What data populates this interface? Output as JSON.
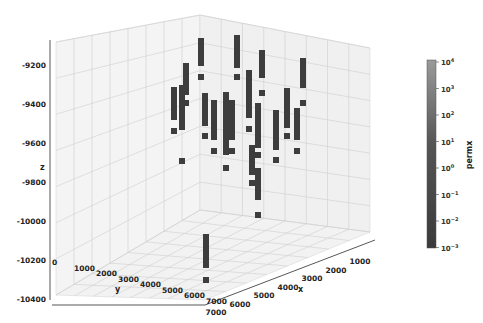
{
  "chart_data": {
    "type": "scatter3d",
    "title": "",
    "xlabel": "x",
    "ylabel": "y",
    "zlabel": "z",
    "x_ticks": [
      "1000",
      "2000",
      "3000",
      "4000",
      "5000",
      "6000",
      "7000"
    ],
    "y_ticks": [
      "0",
      "1000",
      "2000",
      "3000",
      "4000",
      "5000",
      "6000",
      "7000"
    ],
    "z_ticks": [
      "-9200",
      "-9400",
      "-9600",
      "-9800",
      "-10000",
      "-10200",
      "-10400"
    ],
    "xlim": [
      500,
      7500
    ],
    "ylim": [
      0,
      7500
    ],
    "zlim": [
      -10600,
      -9050
    ],
    "colorbar": {
      "label": "permx",
      "scale": "log",
      "ticks": [
        "10^4",
        "10^3",
        "10^2",
        "10^1",
        "10^0",
        "10^-1",
        "10^-2",
        "10^-3"
      ],
      "range": [
        0.001,
        10000
      ]
    },
    "marker": "square",
    "marker_color": "#3d3d3d",
    "grid": true,
    "wells_screen_columns": [
      {
        "sx": 201,
        "top": 38,
        "bottom": 66,
        "extra": 74
      },
      {
        "sx": 237,
        "top": 35,
        "bottom": 68,
        "extra": 74
      },
      {
        "sx": 262,
        "top": 50,
        "bottom": 78,
        "extra": 90
      },
      {
        "sx": 303,
        "top": 58,
        "bottom": 88,
        "extra": 100
      },
      {
        "sx": 186,
        "top": 63,
        "bottom": 95,
        "extra": 100
      },
      {
        "sx": 174,
        "top": 87,
        "bottom": 120,
        "extra": 128
      },
      {
        "sx": 182,
        "top": 85,
        "bottom": 130,
        "extra": 158
      },
      {
        "sx": 205,
        "top": 93,
        "bottom": 126,
        "extra": 133
      },
      {
        "sx": 214,
        "top": 100,
        "bottom": 140,
        "extra": 148
      },
      {
        "sx": 226,
        "top": 92,
        "bottom": 155,
        "extra": 165
      },
      {
        "sx": 232,
        "top": 100,
        "bottom": 140,
        "extra": 148
      },
      {
        "sx": 249,
        "top": 70,
        "bottom": 118,
        "extra": 126
      },
      {
        "sx": 258,
        "top": 103,
        "bottom": 148,
        "extra": 152
      },
      {
        "sx": 276,
        "top": 110,
        "bottom": 150,
        "extra": 157
      },
      {
        "sx": 287,
        "top": 88,
        "bottom": 128,
        "extra": 133
      },
      {
        "sx": 297,
        "top": 108,
        "bottom": 140,
        "extra": 148
      },
      {
        "sx": 252,
        "top": 145,
        "bottom": 175,
        "extra": 180
      },
      {
        "sx": 258,
        "top": 168,
        "bottom": 200,
        "extra": 212
      },
      {
        "sx": 206,
        "top": 234,
        "bottom": 268,
        "extra": 277
      }
    ]
  }
}
